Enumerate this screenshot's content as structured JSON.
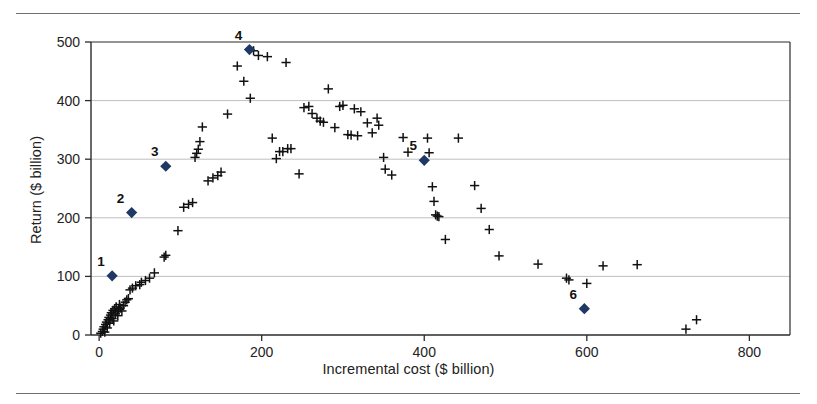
{
  "figure": {
    "has_top_rule": true,
    "has_bottom_rule": true,
    "rule_color": "#6f6f6f",
    "background": "#ffffff"
  },
  "chart_data": {
    "type": "scatter",
    "title": "",
    "xlabel": "Incremental cost ($ billion)",
    "ylabel": "Return ($ billion)",
    "xlim": [
      -10,
      850
    ],
    "ylim": [
      0,
      500
    ],
    "xticks": [
      0,
      200,
      400,
      600,
      800
    ],
    "yticks": [
      0,
      100,
      200,
      300,
      400,
      500
    ],
    "grid": "horizontal",
    "grid_color": "#b8b8b8",
    "axis_color": "#2b2b2b",
    "legend": "none",
    "series": [
      {
        "name": "portfolio options",
        "marker": "plus",
        "color": "#111111",
        "points": [
          [
            2,
            3
          ],
          [
            4,
            6
          ],
          [
            5,
            10
          ],
          [
            6,
            14
          ],
          [
            7,
            5
          ],
          [
            8,
            18
          ],
          [
            9,
            22
          ],
          [
            10,
            12
          ],
          [
            11,
            26
          ],
          [
            12,
            30
          ],
          [
            13,
            20
          ],
          [
            14,
            34
          ],
          [
            15,
            38
          ],
          [
            16,
            28
          ],
          [
            17,
            42
          ],
          [
            18,
            24
          ],
          [
            19,
            45
          ],
          [
            20,
            36
          ],
          [
            21,
            48
          ],
          [
            22,
            40
          ],
          [
            23,
            33
          ],
          [
            24,
            44
          ],
          [
            25,
            52
          ],
          [
            26,
            46
          ],
          [
            28,
            41
          ],
          [
            30,
            50
          ],
          [
            32,
            56
          ],
          [
            34,
            60
          ],
          [
            36,
            62
          ],
          [
            38,
            77
          ],
          [
            41,
            80
          ],
          [
            45,
            84
          ],
          [
            50,
            86
          ],
          [
            52,
            90
          ],
          [
            57,
            93
          ],
          [
            62,
            97
          ],
          [
            68,
            106
          ],
          [
            80,
            133
          ],
          [
            82,
            136
          ],
          [
            97,
            178
          ],
          [
            104,
            218
          ],
          [
            110,
            223
          ],
          [
            115,
            226
          ],
          [
            118,
            303
          ],
          [
            120,
            310
          ],
          [
            122,
            317
          ],
          [
            124,
            330
          ],
          [
            127,
            355
          ],
          [
            134,
            263
          ],
          [
            140,
            268
          ],
          [
            146,
            272
          ],
          [
            150,
            278
          ],
          [
            158,
            377
          ],
          [
            170,
            459
          ],
          [
            178,
            433
          ],
          [
            186,
            404
          ],
          [
            190,
            485
          ],
          [
            196,
            477
          ],
          [
            207,
            475
          ],
          [
            213,
            336
          ],
          [
            218,
            301
          ],
          [
            222,
            313
          ],
          [
            226,
            313
          ],
          [
            230,
            465
          ],
          [
            232,
            318
          ],
          [
            236,
            318
          ],
          [
            246,
            275
          ],
          [
            252,
            388
          ],
          [
            258,
            390
          ],
          [
            262,
            378
          ],
          [
            268,
            370
          ],
          [
            272,
            365
          ],
          [
            276,
            363
          ],
          [
            282,
            420
          ],
          [
            290,
            354
          ],
          [
            296,
            390
          ],
          [
            300,
            392
          ],
          [
            306,
            342
          ],
          [
            310,
            341
          ],
          [
            314,
            386
          ],
          [
            318,
            340
          ],
          [
            322,
            381
          ],
          [
            330,
            362
          ],
          [
            336,
            345
          ],
          [
            342,
            370
          ],
          [
            344,
            358
          ],
          [
            350,
            303
          ],
          [
            352,
            283
          ],
          [
            360,
            273
          ],
          [
            374,
            337
          ],
          [
            380,
            312
          ],
          [
            404,
            336
          ],
          [
            406,
            311
          ],
          [
            410,
            253
          ],
          [
            412,
            228
          ],
          [
            414,
            205
          ],
          [
            416,
            203
          ],
          [
            418,
            202
          ],
          [
            426,
            163
          ],
          [
            442,
            336
          ],
          [
            462,
            255
          ],
          [
            470,
            216
          ],
          [
            480,
            180
          ],
          [
            492,
            135
          ],
          [
            540,
            121
          ],
          [
            575,
            97
          ],
          [
            578,
            94
          ],
          [
            600,
            88
          ],
          [
            620,
            118
          ],
          [
            662,
            120
          ],
          [
            722,
            10
          ],
          [
            735,
            26
          ]
        ]
      },
      {
        "name": "selected portfolios",
        "marker": "diamond",
        "color": "#1f3864",
        "points": [
          {
            "label": "1",
            "x": 16,
            "y": 101
          },
          {
            "label": "2",
            "x": 40,
            "y": 209
          },
          {
            "label": "3",
            "x": 82,
            "y": 288
          },
          {
            "label": "4",
            "x": 185,
            "y": 487
          },
          {
            "label": "5",
            "x": 400,
            "y": 298
          },
          {
            "label": "6",
            "x": 597,
            "y": 45
          }
        ]
      }
    ]
  }
}
